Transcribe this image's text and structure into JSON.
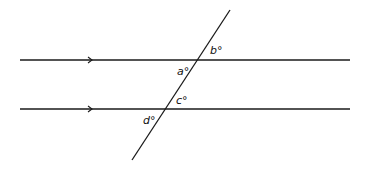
{
  "diagram": {
    "stroke_color": "#1a1a1a",
    "parallel_lines": [
      {
        "name": "top-line",
        "x1": 20,
        "y1": 60,
        "x2": 350,
        "y2": 60,
        "arrow_x": 90
      },
      {
        "name": "bottom-line",
        "x1": 20,
        "y1": 109,
        "x2": 350,
        "y2": 109,
        "arrow_x": 90
      }
    ],
    "transversal": {
      "x1": 230,
      "y1": 10,
      "x2": 132,
      "y2": 160
    },
    "angles": [
      {
        "letter": "a",
        "degree": "°",
        "x": 177,
        "y": 75
      },
      {
        "letter": "b",
        "degree": "°",
        "x": 210,
        "y": 54
      },
      {
        "letter": "c",
        "degree": "°",
        "x": 176,
        "y": 104
      },
      {
        "letter": "d",
        "degree": "°",
        "x": 143,
        "y": 124
      }
    ]
  }
}
